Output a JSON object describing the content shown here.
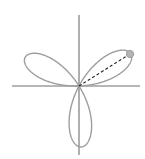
{
  "figure": {
    "title": "",
    "background_color": "#ffffff",
    "width": 145,
    "height": 159
  },
  "axes": {
    "name": "cartesian-crosshair",
    "color": "#6e6e6e",
    "line_width": 1.1,
    "origin": {
      "x": 79,
      "y": 86
    },
    "x_axis": {
      "label": "",
      "start_x": 12,
      "end_x": 140,
      "y": 86
    },
    "y_axis": {
      "label": "",
      "start_y": 15,
      "end_y": 155,
      "x": 79
    },
    "ticks": [],
    "tick_labels": [],
    "grid": false
  },
  "annotation": {
    "radius_line": {
      "name": "radius-dashed-line",
      "style": "dashed",
      "color": "#1a1a1a",
      "line_width": 1.1,
      "dash_pattern": "3,2.2",
      "from": {
        "x": 79,
        "y": 86
      },
      "to": {
        "x": 130,
        "y": 54
      },
      "angle_degrees": 32,
      "label": ""
    },
    "point_marker": {
      "name": "petal-tip-marker",
      "shape": "circle",
      "color": "#9a9a9a",
      "fill": "#b5b5b5",
      "radius": 3.6,
      "x": 130,
      "y": 54,
      "label": ""
    },
    "edge_marks": [
      {
        "text": "·",
        "x": 142,
        "y": 44
      },
      {
        "text": "·",
        "x": 142,
        "y": 54
      }
    ]
  },
  "chart_data": {
    "type": "line",
    "subtype": "polar-rose-curve",
    "title": "",
    "subtitle": "",
    "xlabel": "",
    "ylabel": "",
    "grid": false,
    "legend": [],
    "legend_position": "none",
    "curve_color": "#9e9e9e",
    "curve_line_width": 1.4,
    "equation": "r = a*cos(3*theta)",
    "petal_count": 3,
    "amplitude_px": 61,
    "petal_angles_degrees": [
      32,
      150,
      270
    ],
    "theta_range_degrees": [
      0,
      360
    ],
    "xlim": [
      -79,
      66
    ],
    "ylim": [
      -73,
      86
    ],
    "series": [
      {
        "name": "rose-curve",
        "points_polar": [
          {
            "theta_deg": 32,
            "r": 61
          },
          {
            "theta_deg": 150,
            "r": 61
          },
          {
            "theta_deg": 270,
            "r": 61
          }
        ],
        "petal_tips_px": [
          {
            "x": 130,
            "y": 54
          },
          {
            "x": 28,
            "y": 50
          },
          {
            "x": 79,
            "y": 147
          }
        ]
      }
    ],
    "annotations": [
      {
        "name": "radius-vector",
        "type": "dashed-line-with-point",
        "from_px": {
          "x": 79,
          "y": 86
        },
        "to_px": {
          "x": 130,
          "y": 54
        },
        "text": ""
      }
    ]
  }
}
